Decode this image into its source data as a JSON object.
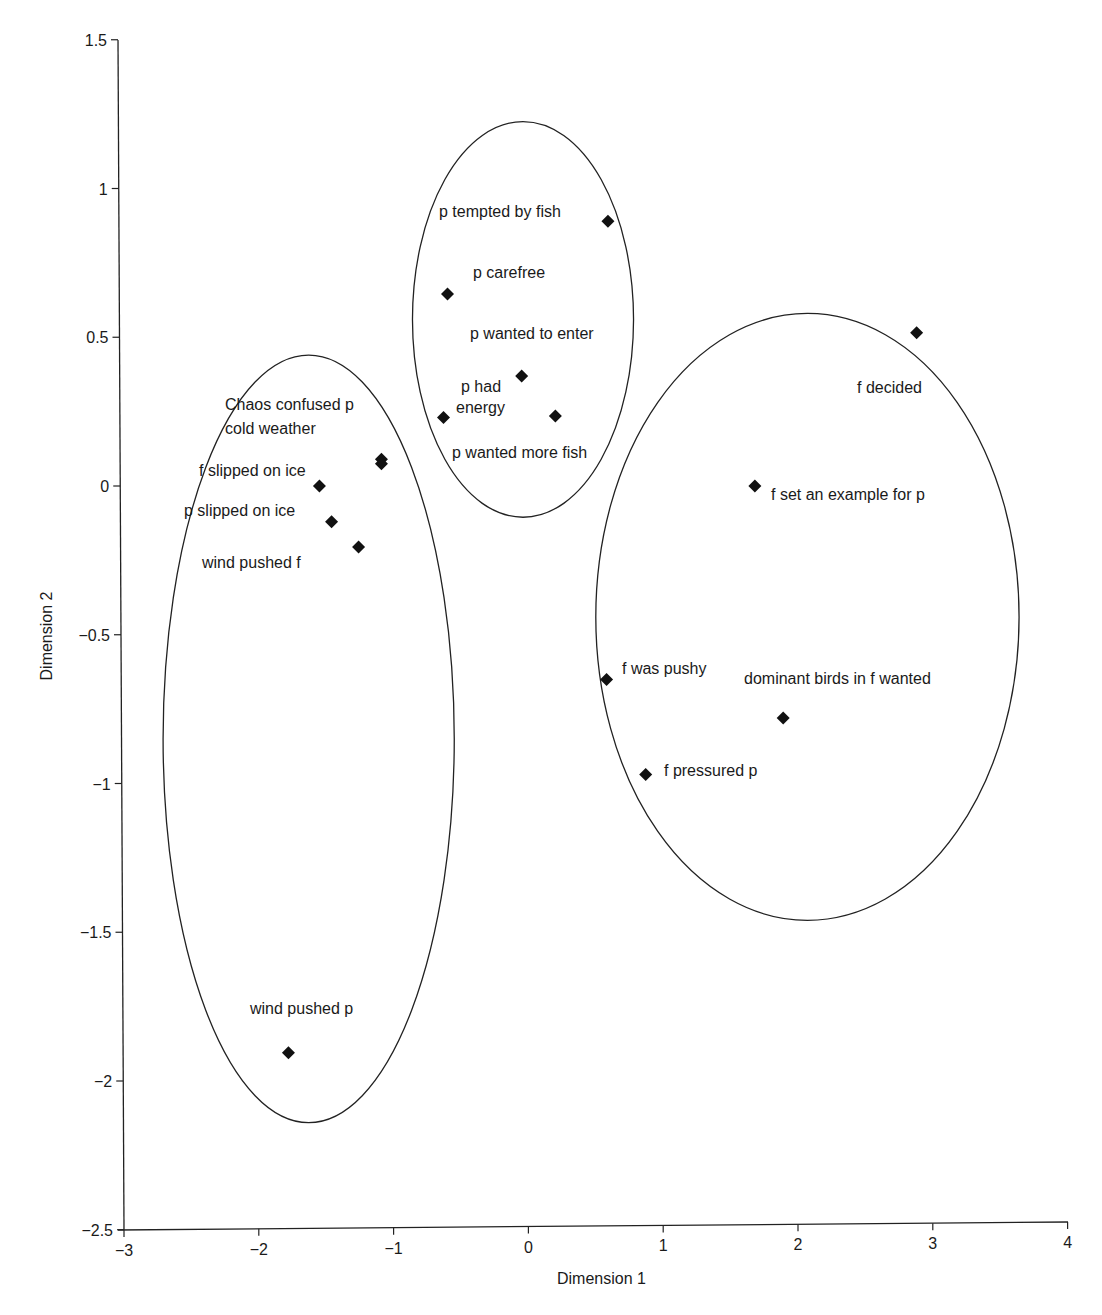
{
  "chart_data": {
    "type": "scatter",
    "title": "",
    "xlabel": "Dimension 1",
    "ylabel": "Dimension 2",
    "xlim": [
      -3,
      4
    ],
    "ylim": [
      -2.5,
      1.5
    ],
    "grid": false,
    "legend": null,
    "x_ticks": [
      "−3",
      "−2",
      "−1",
      "0",
      "1",
      "2",
      "3",
      "4"
    ],
    "y_ticks": [
      "1.5",
      "1",
      "0.5",
      "0",
      "−0.5",
      "−1",
      "−1.5",
      "−2",
      "−2.5"
    ],
    "marker": "diamond",
    "marker_color": "#111111",
    "points": [
      {
        "label": "p tempted by fish",
        "x": 0.59,
        "y": 0.89,
        "cluster": 2
      },
      {
        "label": "p carefree",
        "x": -0.6,
        "y": 0.645,
        "cluster": 2
      },
      {
        "label": "p wanted to enter",
        "x": -0.05,
        "y": 0.37,
        "cluster": 2
      },
      {
        "label": "p had energy",
        "x": -0.63,
        "y": 0.23,
        "cluster": 2
      },
      {
        "label": "p wanted more fish",
        "x": 0.2,
        "y": 0.235,
        "cluster": 2
      },
      {
        "label": "Chaos confused p",
        "x": -1.09,
        "y": 0.09,
        "cluster": 1
      },
      {
        "label": "cold weather",
        "x": -1.09,
        "y": 0.075,
        "cluster": 1
      },
      {
        "label": "f slipped on ice",
        "x": -1.55,
        "y": 0.0,
        "cluster": 1
      },
      {
        "label": "p slipped on ice",
        "x": -1.46,
        "y": -0.12,
        "cluster": 1
      },
      {
        "label": "wind pushed f",
        "x": -1.26,
        "y": -0.205,
        "cluster": 1
      },
      {
        "label": "wind pushed p",
        "x": -1.78,
        "y": -1.905,
        "cluster": 1
      },
      {
        "label": "f decided",
        "x": 2.88,
        "y": 0.515,
        "cluster": 3
      },
      {
        "label": "f set an example for p",
        "x": 1.68,
        "y": 0.0,
        "cluster": 3
      },
      {
        "label": "f was pushy",
        "x": 0.58,
        "y": -0.65,
        "cluster": 3
      },
      {
        "label": "dominant birds in f wanted",
        "x": 1.89,
        "y": -0.78,
        "cluster": 3
      },
      {
        "label": "f pressured p",
        "x": 0.87,
        "y": -0.97,
        "cluster": 3
      }
    ],
    "annotations": [
      {
        "type": "ellipse",
        "cluster": 1,
        "cx": -1.63,
        "cy": -0.85,
        "rx": 1.08,
        "ry": 1.29
      },
      {
        "type": "ellipse",
        "cluster": 2,
        "cx": -0.04,
        "cy": 0.56,
        "rx": 0.82,
        "ry": 0.665
      },
      {
        "type": "ellipse",
        "cluster": 3,
        "cx": 2.07,
        "cy": -0.44,
        "rx": 1.57,
        "ry": 1.02
      }
    ]
  },
  "text_labels": [
    {
      "text": "p tempted by fish",
      "px": 439,
      "py": 217
    },
    {
      "text": "p carefree",
      "px": 473,
      "py": 278
    },
    {
      "text": "p wanted to enter",
      "px": 470,
      "py": 339
    },
    {
      "text": "p had",
      "px": 461,
      "py": 392
    },
    {
      "text": "energy",
      "px": 456,
      "py": 413
    },
    {
      "text": "p wanted more fish",
      "px": 452,
      "py": 458
    },
    {
      "text": "Chaos confused p",
      "px": 225,
      "py": 410
    },
    {
      "text": "cold weather",
      "px": 225,
      "py": 434
    },
    {
      "text": "f slipped on ice",
      "px": 199,
      "py": 476
    },
    {
      "text": "p slipped on ice",
      "px": 184,
      "py": 516
    },
    {
      "text": "wind pushed f",
      "px": 202,
      "py": 568
    },
    {
      "text": "wind pushed p",
      "px": 250,
      "py": 1014
    },
    {
      "text": "f decided",
      "px": 857,
      "py": 393
    },
    {
      "text": "f set an example for p",
      "px": 771,
      "py": 500
    },
    {
      "text": "f was pushy",
      "px": 622,
      "py": 674
    },
    {
      "text": "dominant birds in f wanted",
      "px": 744,
      "py": 684
    },
    {
      "text": "f pressured p",
      "px": 664,
      "py": 776
    }
  ]
}
